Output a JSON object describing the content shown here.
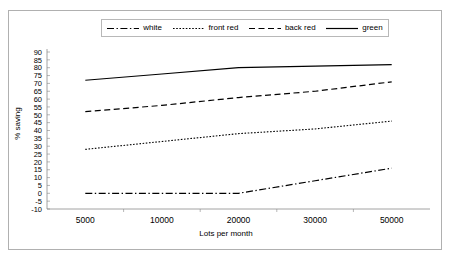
{
  "chart_data": {
    "type": "line",
    "title": "",
    "xlabel": "Lots per month",
    "ylabel": "% saving",
    "categories": [
      "5000",
      "10000",
      "20000",
      "30000",
      "50000"
    ],
    "ylim": [
      -10,
      90
    ],
    "ytick_step": 5,
    "yticks": [
      90,
      85,
      80,
      75,
      70,
      65,
      60,
      55,
      50,
      45,
      40,
      35,
      30,
      25,
      20,
      15,
      10,
      5,
      0,
      -5,
      -10
    ],
    "grid": false,
    "legend_position": "top",
    "series": [
      {
        "name": "white",
        "style": "dash-dot",
        "color": "#000000",
        "values": [
          0,
          0,
          0,
          8,
          16
        ]
      },
      {
        "name": "front red",
        "style": "dotted",
        "color": "#000000",
        "values": [
          28,
          33,
          38,
          41,
          46
        ]
      },
      {
        "name": "back red",
        "style": "dashed",
        "color": "#000000",
        "values": [
          52,
          56,
          61,
          65,
          71
        ]
      },
      {
        "name": "green",
        "style": "solid",
        "color": "#000000",
        "values": [
          72,
          76,
          80,
          81,
          82
        ]
      }
    ]
  },
  "legend": {
    "entries": [
      {
        "label": "white"
      },
      {
        "label": "front red"
      },
      {
        "label": "back red"
      },
      {
        "label": "green"
      }
    ]
  },
  "axes": {
    "ylabel": "% saving",
    "xlabel": "Lots per month"
  }
}
